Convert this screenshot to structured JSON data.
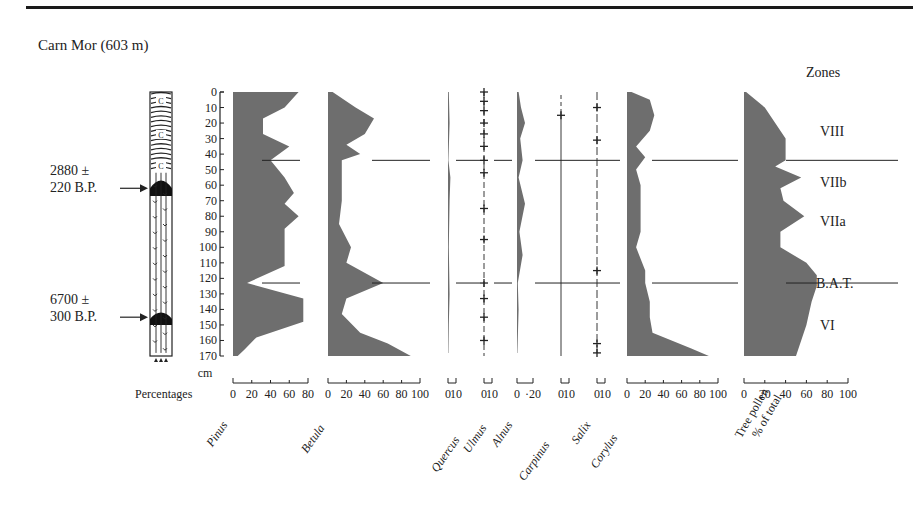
{
  "title": "Carn Mor  (603 m)",
  "zones_header": "Zones",
  "depth_unit": "cm",
  "percentages_label": "Percentages",
  "dates": [
    {
      "line1": "2880 ±",
      "line2": "220 B.P.",
      "depth_cm": 62
    },
    {
      "line1": "6700 ±",
      "line2": "300 B.P.",
      "depth_cm": 145
    }
  ],
  "zones": [
    {
      "label": "VIII",
      "center_cm": 25
    },
    {
      "label": "VIIb",
      "center_cm": 58
    },
    {
      "label": "VIIa",
      "center_cm": 83
    },
    {
      "label": "B.A.T.",
      "center_cm": 123
    },
    {
      "label": "VI",
      "center_cm": 150
    }
  ],
  "zone_boundaries_cm": [
    44,
    123
  ],
  "chart_data": {
    "type": "area",
    "title": "Carn Mor (603 m)",
    "xlabel": "Percentages",
    "ylabel": "Depth (cm)",
    "ylim": [
      0,
      170
    ],
    "depth_ticks": [
      0,
      10,
      20,
      30,
      40,
      50,
      60,
      70,
      80,
      90,
      100,
      110,
      120,
      130,
      140,
      150,
      160,
      170
    ],
    "zones": [
      "VIII",
      "VIIb",
      "VIIa",
      "B.A.T.",
      "VI"
    ],
    "zone_boundaries_cm": [
      44,
      123
    ],
    "series": [
      {
        "name": "Pinus",
        "axis": [
          0,
          80
        ],
        "ticks": [
          "0",
          "20",
          "40",
          "60",
          "80"
        ],
        "depth": [
          0,
          10,
          17,
          27,
          35,
          44,
          55,
          65,
          72,
          80,
          88,
          100,
          112,
          123,
          133,
          148,
          158,
          166,
          170
        ],
        "values": [
          70,
          55,
          32,
          32,
          60,
          40,
          55,
          65,
          55,
          70,
          55,
          55,
          55,
          15,
          75,
          75,
          25,
          12,
          5
        ]
      },
      {
        "name": "Betula",
        "axis": [
          0,
          100
        ],
        "ticks": [
          "0",
          "20",
          "40",
          "60",
          "80",
          "100"
        ],
        "depth": [
          0,
          10,
          17,
          27,
          34,
          40,
          44,
          55,
          70,
          85,
          100,
          110,
          123,
          133,
          143,
          155,
          162,
          170
        ],
        "values": [
          5,
          30,
          50,
          40,
          20,
          35,
          15,
          15,
          15,
          12,
          25,
          20,
          60,
          20,
          15,
          35,
          65,
          90
        ],
        "note": "peaks ~50% at 20cm, ~60% at 123cm, ~90% at base"
      },
      {
        "name": "Quercus",
        "axis": [
          0,
          10
        ],
        "ticks": [
          "0",
          "10"
        ],
        "depth": [
          0,
          20,
          44,
          55,
          70,
          100,
          130,
          150,
          168
        ],
        "values": [
          1,
          2,
          0.5,
          3,
          2,
          1,
          2,
          1,
          0.5
        ]
      },
      {
        "name": "Ulmus",
        "axis": [
          0,
          10
        ],
        "ticks": [
          "0",
          "10"
        ],
        "style": "trace",
        "trace_depths_cm": [
          0,
          6,
          12,
          20,
          27,
          35,
          44,
          52,
          75,
          95,
          123,
          133,
          145,
          160
        ]
      },
      {
        "name": "Alnus",
        "axis": [
          0,
          20
        ],
        "ticks": [
          "0",
          "·20"
        ],
        "depth": [
          0,
          10,
          20,
          30,
          44,
          55,
          72,
          90,
          105,
          123,
          140,
          168
        ],
        "values": [
          2,
          5,
          10,
          4,
          7,
          2,
          10,
          3,
          7,
          1,
          2,
          0.5
        ]
      },
      {
        "name": "Carpinus",
        "axis": [
          0,
          10
        ],
        "ticks": [
          "0",
          "10"
        ],
        "style": "trace",
        "trace_depths_cm": [
          15
        ]
      },
      {
        "name": "Salix",
        "axis": [
          0,
          10
        ],
        "ticks": [
          "0",
          "10"
        ],
        "style": "trace",
        "trace_depths_cm": [
          10,
          31,
          115,
          162,
          168
        ]
      },
      {
        "name": "Corylus",
        "axis": [
          0,
          100
        ],
        "ticks": [
          "0",
          "20",
          "40",
          "60",
          "80",
          "100"
        ],
        "depth": [
          0,
          5,
          15,
          25,
          35,
          42,
          50,
          60,
          75,
          90,
          100,
          115,
          123,
          135,
          145,
          155,
          165,
          170
        ],
        "values": [
          5,
          25,
          30,
          25,
          10,
          20,
          10,
          15,
          15,
          15,
          10,
          20,
          20,
          25,
          25,
          28,
          70,
          90
        ]
      },
      {
        "name": "Tree pollen % of total",
        "axis": [
          0,
          100
        ],
        "ticks": [
          "0",
          "20",
          "40",
          "60",
          "80",
          "100"
        ],
        "depth": [
          0,
          10,
          20,
          30,
          40,
          44,
          48,
          55,
          62,
          70,
          80,
          90,
          100,
          110,
          118,
          125,
          135,
          150,
          170
        ],
        "values": [
          2,
          20,
          30,
          40,
          40,
          40,
          30,
          55,
          35,
          38,
          58,
          35,
          35,
          60,
          70,
          70,
          65,
          60,
          50
        ]
      }
    ]
  },
  "axis_labels": [
    "Pinus",
    "Betula",
    "Quercus",
    "Ulmus",
    "Alnus",
    "Carpinus",
    "Salix",
    "Corylus",
    "Tree pollen",
    "% of total"
  ]
}
